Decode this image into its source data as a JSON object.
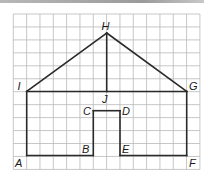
{
  "diagram": {
    "type": "geometry-figure-on-grid",
    "grid": {
      "left": 13.3,
      "top": 14,
      "cell_w": 13.33,
      "cell_h": 12.95,
      "cols": 14,
      "rows": 12,
      "line_color": "#b9b9b9"
    },
    "stroke_color": "#2a2a2a",
    "points": {
      "H": {
        "x": 106.7,
        "y": 33.0,
        "label": "H",
        "lx": 101.5,
        "ly": 29.5
      },
      "I": {
        "x": 26.7,
        "y": 91.5,
        "label": "I",
        "lx": 17.5,
        "ly": 89.5
      },
      "G": {
        "x": 186.7,
        "y": 91.5,
        "label": "G",
        "lx": 189.0,
        "ly": 89.5
      },
      "J": {
        "x": 106.7,
        "y": 91.5,
        "label": "J",
        "lx": 102.0,
        "ly": 103.0
      },
      "C": {
        "x": 93.3,
        "y": 110.7,
        "label": "C",
        "lx": 83.0,
        "ly": 115.0
      },
      "D": {
        "x": 120.0,
        "y": 110.7,
        "label": "D",
        "lx": 122.0,
        "ly": 115.0
      },
      "B": {
        "x": 93.3,
        "y": 155.5,
        "label": "B",
        "lx": 82.0,
        "ly": 153.0
      },
      "E": {
        "x": 120.0,
        "y": 155.5,
        "label": "E",
        "lx": 122.0,
        "ly": 153.0
      },
      "A": {
        "x": 26.7,
        "y": 155.5,
        "label": "A",
        "lx": 15.0,
        "ly": 167.0
      },
      "F": {
        "x": 186.7,
        "y": 155.5,
        "label": "F",
        "lx": 189.0,
        "ly": 167.0
      }
    },
    "segments": [
      [
        "I",
        "H"
      ],
      [
        "H",
        "G"
      ],
      [
        "H",
        "J"
      ],
      [
        "I",
        "G"
      ],
      [
        "I",
        "A"
      ],
      [
        "A",
        "B"
      ],
      [
        "B",
        "C"
      ],
      [
        "C",
        "D"
      ],
      [
        "D",
        "E"
      ],
      [
        "E",
        "F"
      ],
      [
        "F",
        "G"
      ]
    ]
  }
}
